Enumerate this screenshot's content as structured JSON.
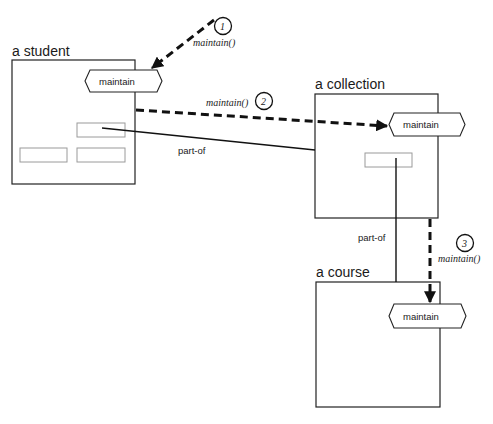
{
  "diagram": {
    "objects": [
      {
        "id": "student",
        "title": "a student",
        "operation": "maintain"
      },
      {
        "id": "collection",
        "title": "a collection",
        "operation": "maintain"
      },
      {
        "id": "course",
        "title": "a course",
        "operation": "maintain"
      }
    ],
    "relations": [
      {
        "label": "part-of",
        "from": "student",
        "to": "collection"
      },
      {
        "label": "part-of",
        "from": "collection",
        "to": "course"
      }
    ],
    "messages": [
      {
        "number": "1",
        "label": "maintain()",
        "target": "student"
      },
      {
        "number": "2",
        "label": "maintain()",
        "from": "student",
        "target": "collection"
      },
      {
        "number": "3",
        "label": "maintain()",
        "from": "collection",
        "target": "course"
      }
    ]
  }
}
